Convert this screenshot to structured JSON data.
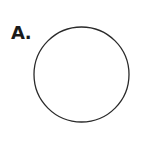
{
  "figure": {
    "label": "A.",
    "shape": "circle",
    "stroke_color": "#2a2a2a",
    "fill_color": "#ffffff"
  }
}
